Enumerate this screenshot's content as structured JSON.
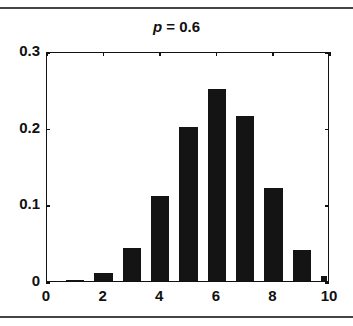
{
  "chart_data": {
    "type": "bar",
    "title": "p = 0.6",
    "title_var": "p",
    "title_rest": " = 0.6",
    "xlabel": "",
    "ylabel": "",
    "x": [
      0,
      1,
      2,
      3,
      4,
      5,
      6,
      7,
      8,
      9,
      10
    ],
    "values": [
      0.0001,
      0.0016,
      0.0106,
      0.0425,
      0.1115,
      0.2007,
      0.2508,
      0.215,
      0.1209,
      0.0403,
      0.006
    ],
    "xlim": [
      0,
      10
    ],
    "ylim": [
      0,
      0.3
    ],
    "xticks": [
      "0",
      "2",
      "4",
      "6",
      "8",
      "10"
    ],
    "yticks": [
      "0",
      "0.1",
      "0.2",
      "0.3"
    ],
    "grid": false,
    "legend": null,
    "bar_color": "#141414"
  }
}
